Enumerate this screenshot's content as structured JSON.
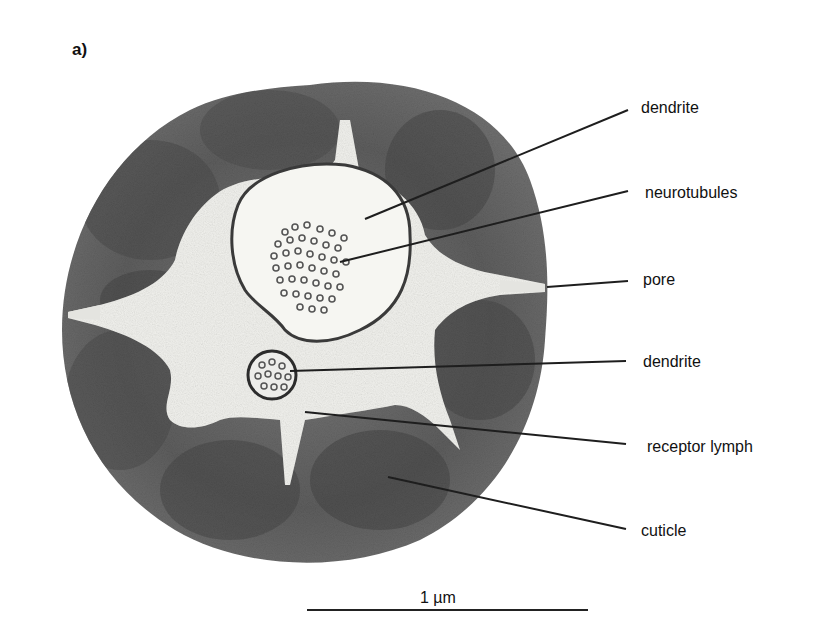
{
  "figure": {
    "panel_label": "a)",
    "colors": {
      "cuticle": "#5e5e5e",
      "cuticle_dark": "#4a4a4a",
      "receptor_lymph": "#f2f2ee",
      "membrane": "#333333",
      "leader_line": "#1e1e1e"
    }
  },
  "labels": [
    {
      "id": "dendrite-large",
      "text": "dendrite"
    },
    {
      "id": "neurotubules",
      "text": "neurotubules"
    },
    {
      "id": "pore",
      "text": "pore"
    },
    {
      "id": "dendrite-small",
      "text": "dendrite"
    },
    {
      "id": "receptor-lymph",
      "text": "receptor lymph"
    },
    {
      "id": "cuticle",
      "text": "cuticle"
    }
  ],
  "scale_bar": {
    "label": "1 µm"
  }
}
